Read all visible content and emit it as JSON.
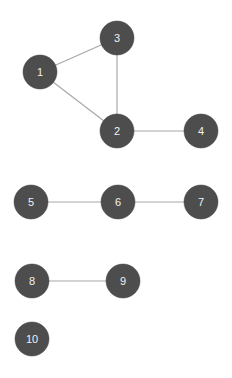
{
  "diagram": {
    "type": "undirected-graph",
    "node_radius": 17,
    "colors": {
      "node_fill": "#4d4d4d",
      "node_label": "#f2f2f2",
      "edge": "#a8a8a8",
      "background": "#ffffff"
    },
    "nodes": [
      {
        "id": "1",
        "label": "1",
        "x": 40,
        "y": 72
      },
      {
        "id": "2",
        "label": "2",
        "x": 117,
        "y": 131
      },
      {
        "id": "3",
        "label": "3",
        "x": 117,
        "y": 38
      },
      {
        "id": "4",
        "label": "4",
        "x": 201,
        "y": 131
      },
      {
        "id": "5",
        "label": "5",
        "x": 31,
        "y": 202
      },
      {
        "id": "6",
        "label": "6",
        "x": 118,
        "y": 202
      },
      {
        "id": "7",
        "label": "7",
        "x": 201,
        "y": 202
      },
      {
        "id": "8",
        "label": "8",
        "x": 32,
        "y": 281
      },
      {
        "id": "9",
        "label": "9",
        "x": 123,
        "y": 281
      },
      {
        "id": "10",
        "label": "10",
        "x": 32,
        "y": 339
      }
    ],
    "edges": [
      {
        "from": "1",
        "to": "3"
      },
      {
        "from": "1",
        "to": "2"
      },
      {
        "from": "3",
        "to": "2"
      },
      {
        "from": "2",
        "to": "4"
      },
      {
        "from": "5",
        "to": "6"
      },
      {
        "from": "6",
        "to": "7"
      },
      {
        "from": "8",
        "to": "9"
      }
    ]
  }
}
